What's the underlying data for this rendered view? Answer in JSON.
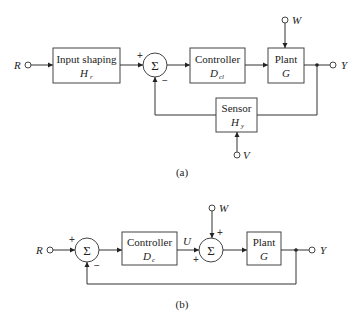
{
  "diagram_a": {
    "caption": "(a)",
    "input_label": "R",
    "output_label": "Y",
    "disturbance_label": "W",
    "noise_label": "V",
    "input_shaping": {
      "name": "Input shaping",
      "symbol": "H",
      "sub": "r"
    },
    "summer": {
      "symbol": "Σ",
      "sign_top": "+",
      "sign_bottom": "−"
    },
    "controller": {
      "name": "Controller",
      "symbol": "D",
      "sub": "cl"
    },
    "plant": {
      "name": "Plant",
      "symbol": "G"
    },
    "sensor": {
      "name": "Sensor",
      "symbol": "H",
      "sub": "y"
    }
  },
  "diagram_b": {
    "caption": "(b)",
    "input_label": "R",
    "output_label": "Y",
    "disturbance_label": "W",
    "control_label": "U",
    "summer1": {
      "symbol": "Σ",
      "sign_left": "+",
      "sign_bottom": "−"
    },
    "controller": {
      "name": "Controller",
      "symbol": "D",
      "sub": "c"
    },
    "summer2": {
      "symbol": "Σ",
      "sign_top": "+",
      "sign_left": "+"
    },
    "plant": {
      "name": "Plant",
      "symbol": "G"
    }
  },
  "colors": {
    "line": "#333333",
    "background": "#ffffff"
  }
}
